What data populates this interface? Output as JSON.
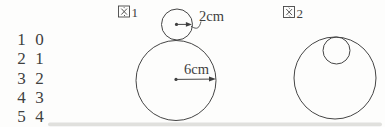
{
  "figure1": {
    "label": "図1",
    "label_kanji": "図",
    "label_number": "1",
    "small_circle_radius_label": "2cm",
    "large_circle_radius_label": "6cm"
  },
  "figure2": {
    "label": "図2",
    "label_kanji": "図",
    "label_number": "2"
  },
  "number_table": {
    "rows": [
      [
        "1",
        "0"
      ],
      [
        "2",
        "1"
      ],
      [
        "3",
        "2"
      ],
      [
        "4",
        "3"
      ],
      [
        "5",
        "4"
      ]
    ]
  },
  "colors": {
    "ink": "#3f3f3f",
    "background": "#fdfdfc"
  }
}
